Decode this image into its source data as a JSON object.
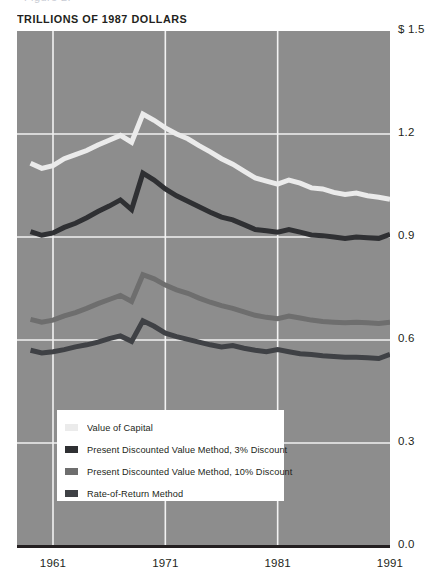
{
  "page": {
    "top_cut_text": "Figure 2."
  },
  "chart_data": {
    "type": "line",
    "title": "TRILLIONS OF 1987 DOLLARS",
    "subtitle": "",
    "xlabel": "",
    "ylabel": "",
    "xlim": [
      1959,
      1991
    ],
    "ylim": [
      0.0,
      1.5
    ],
    "grid": true,
    "legend_position": "inside-bottom-left",
    "y_ticks": [
      {
        "value": 1.5,
        "label": "$ 1.5"
      },
      {
        "value": 1.2,
        "label": "1.2"
      },
      {
        "value": 0.9,
        "label": "0.9"
      },
      {
        "value": 0.6,
        "label": "0.6"
      },
      {
        "value": 0.3,
        "label": "0.3"
      },
      {
        "value": 0.0,
        "label": "0.0"
      }
    ],
    "x_ticks": [
      {
        "value": 1961,
        "label": "1961"
      },
      {
        "value": 1971,
        "label": "1971"
      },
      {
        "value": 1981,
        "label": "1981"
      },
      {
        "value": 1991,
        "label": "1991"
      }
    ],
    "x": [
      1959,
      1960,
      1961,
      1962,
      1963,
      1964,
      1965,
      1966,
      1967,
      1968,
      1969,
      1970,
      1971,
      1972,
      1973,
      1974,
      1975,
      1976,
      1977,
      1978,
      1979,
      1980,
      1981,
      1982,
      1983,
      1984,
      1985,
      1986,
      1987,
      1988,
      1989,
      1990,
      1991
    ],
    "series": [
      {
        "name": "Value of Capital",
        "color": "#ebebeb",
        "values": [
          1.115,
          1.1,
          1.108,
          1.128,
          1.14,
          1.152,
          1.168,
          1.182,
          1.196,
          1.176,
          1.258,
          1.24,
          1.218,
          1.2,
          1.186,
          1.166,
          1.148,
          1.128,
          1.112,
          1.092,
          1.072,
          1.063,
          1.054,
          1.066,
          1.057,
          1.043,
          1.04,
          1.03,
          1.024,
          1.028,
          1.02,
          1.016,
          1.01
        ]
      },
      {
        "name": "Present Discounted Value Method, 3% Discount",
        "color": "#2f3033",
        "values": [
          0.916,
          0.905,
          0.912,
          0.928,
          0.94,
          0.956,
          0.974,
          0.99,
          1.008,
          0.98,
          1.086,
          1.066,
          1.04,
          1.02,
          1.004,
          0.988,
          0.972,
          0.958,
          0.95,
          0.936,
          0.922,
          0.918,
          0.914,
          0.922,
          0.914,
          0.906,
          0.904,
          0.9,
          0.896,
          0.9,
          0.898,
          0.896,
          0.908
        ]
      },
      {
        "name": "Present Discounted Value Method, 10% Discount",
        "color": "#6e6e6e",
        "values": [
          0.66,
          0.652,
          0.658,
          0.67,
          0.68,
          0.692,
          0.706,
          0.718,
          0.73,
          0.712,
          0.79,
          0.778,
          0.76,
          0.746,
          0.736,
          0.722,
          0.71,
          0.7,
          0.692,
          0.682,
          0.672,
          0.666,
          0.662,
          0.67,
          0.664,
          0.658,
          0.654,
          0.652,
          0.65,
          0.652,
          0.65,
          0.648,
          0.652
        ]
      },
      {
        "name": "Rate-of-Return Method",
        "color": "#3f4145",
        "values": [
          0.57,
          0.562,
          0.566,
          0.572,
          0.58,
          0.586,
          0.594,
          0.604,
          0.612,
          0.596,
          0.656,
          0.64,
          0.62,
          0.61,
          0.602,
          0.594,
          0.586,
          0.58,
          0.584,
          0.576,
          0.57,
          0.566,
          0.572,
          0.566,
          0.56,
          0.558,
          0.554,
          0.552,
          0.55,
          0.55,
          0.548,
          0.546,
          0.558
        ]
      }
    ]
  },
  "legend": [
    {
      "label": "Value of Capital",
      "color": "#ebebeb"
    },
    {
      "label": "Present Discounted Value Method, 3% Discount",
      "color": "#2f3033"
    },
    {
      "label": "Present Discounted Value Method, 10% Discount",
      "color": "#6e6e6e"
    },
    {
      "label": "Rate-of-Return Method",
      "color": "#3f4145"
    }
  ]
}
